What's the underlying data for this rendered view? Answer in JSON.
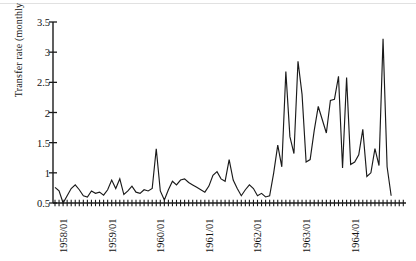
{
  "chart_data": {
    "type": "line",
    "title": "",
    "xlabel": "",
    "ylabel": "Transfer rate (monthly values)",
    "ylim": [
      0.5,
      3.5
    ],
    "ytick_labels": [
      "0.5",
      "1",
      "1.5",
      "2",
      "2.5",
      "3",
      "3.5"
    ],
    "ytick_values": [
      0.5,
      1,
      1.5,
      2,
      2.5,
      3,
      3.5
    ],
    "xtick_labels": [
      "1958/01",
      "1959/01",
      "1960/01",
      "1961/01",
      "1962/01",
      "1963/01",
      "1964/01"
    ],
    "xtick_values": [
      "1958-01",
      "1959-01",
      "1960-01",
      "1961-01",
      "1962-01",
      "1963-01",
      "1964-01"
    ],
    "minor_ticks": "monthly",
    "grid": false,
    "legend": false,
    "line_color": "#1a1a1a",
    "x_start": "1958-01",
    "x_end": "1964-12",
    "x": [
      "1958-01",
      "1958-02",
      "1958-03",
      "1958-04",
      "1958-05",
      "1958-06",
      "1958-07",
      "1958-08",
      "1958-09",
      "1958-10",
      "1958-11",
      "1958-12",
      "1959-01",
      "1959-02",
      "1959-03",
      "1959-04",
      "1959-05",
      "1959-06",
      "1959-07",
      "1959-08",
      "1959-09",
      "1959-10",
      "1959-11",
      "1959-12",
      "1960-01",
      "1960-02",
      "1960-03",
      "1960-04",
      "1960-05",
      "1960-06",
      "1960-07",
      "1960-08",
      "1960-09",
      "1960-10",
      "1960-11",
      "1960-12",
      "1961-01",
      "1961-02",
      "1961-03",
      "1961-04",
      "1961-05",
      "1961-06",
      "1961-07",
      "1961-08",
      "1961-09",
      "1961-10",
      "1961-11",
      "1961-12",
      "1962-01",
      "1962-02",
      "1962-03",
      "1962-04",
      "1962-05",
      "1962-06",
      "1962-07",
      "1962-08",
      "1962-09",
      "1962-10",
      "1962-11",
      "1962-12",
      "1963-01",
      "1963-02",
      "1963-03",
      "1963-04",
      "1963-05",
      "1963-06",
      "1963-07",
      "1963-08",
      "1963-09",
      "1963-10",
      "1963-11",
      "1963-12",
      "1964-01",
      "1964-02",
      "1964-03",
      "1964-04",
      "1964-05",
      "1964-06",
      "1964-07",
      "1964-08",
      "1964-09",
      "1964-10",
      "1964-11",
      "1964-12"
    ],
    "values": [
      0.76,
      0.7,
      0.5,
      0.62,
      0.74,
      0.8,
      0.72,
      0.62,
      0.6,
      0.7,
      0.66,
      0.68,
      0.63,
      0.72,
      0.88,
      0.74,
      0.9,
      0.64,
      0.7,
      0.78,
      0.68,
      0.66,
      0.72,
      0.7,
      0.74,
      1.4,
      0.7,
      0.55,
      0.72,
      0.86,
      0.8,
      0.88,
      0.9,
      0.84,
      0.8,
      0.76,
      0.72,
      0.68,
      0.78,
      0.96,
      1.02,
      0.9,
      0.86,
      1.22,
      0.88,
      0.74,
      0.62,
      0.72,
      0.8,
      0.74,
      0.62,
      0.66,
      0.6,
      0.62,
      1.0,
      1.46,
      1.1,
      2.68,
      1.6,
      1.32,
      2.85,
      2.3,
      1.18,
      1.22,
      1.7,
      2.1,
      1.88,
      1.66,
      2.2,
      2.22,
      2.6,
      1.08,
      2.58,
      1.14,
      1.18,
      1.3,
      1.72,
      0.94,
      1.0,
      1.4,
      1.12,
      3.22,
      1.1,
      0.62
    ],
    "notes": {
      "max_value": 3.22,
      "max_point": "1964-10",
      "min_value": 0.5,
      "final_value": 0.55
    }
  },
  "axes": {
    "y_axis_name": "Transfer rate (monthly values)",
    "x_axis_name": ""
  }
}
